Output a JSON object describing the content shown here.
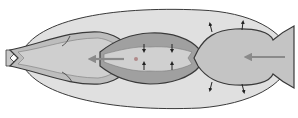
{
  "diagram": {
    "title": "",
    "colors": {
      "background": "#ffffff",
      "outer_envelope": "#e0e0e0",
      "left_chamber": "#bdbdbd",
      "middle_chamber_wall": "#a0a0a0",
      "middle_chamber_inner": "#d0d0d0",
      "right_chamber": "#c4c4c4",
      "outline": "#3a3a3a",
      "flow_arrow": "#8a8a8a",
      "dot": "#b08a8a"
    },
    "elements": [
      {
        "id": "outer-envelope",
        "label": ""
      },
      {
        "id": "left-chamber",
        "label": ""
      },
      {
        "id": "middle-chamber",
        "label": ""
      },
      {
        "id": "right-chamber",
        "label": ""
      },
      {
        "id": "flow-arrow-left",
        "direction": "left"
      },
      {
        "id": "flow-arrow-right",
        "direction": "left"
      },
      {
        "id": "expansion-arrows",
        "count": 4,
        "direction": "outward"
      },
      {
        "id": "contraction-arrows",
        "count": 4,
        "direction": "inward"
      }
    ]
  }
}
